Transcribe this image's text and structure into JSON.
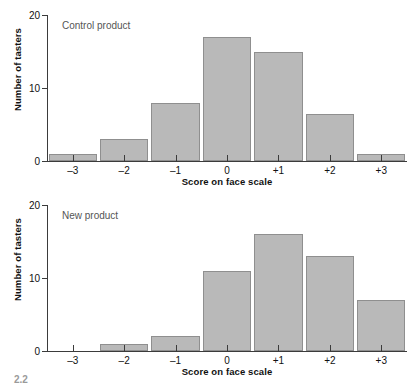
{
  "figure": {
    "caption": "2.2"
  },
  "chart_data": [
    {
      "type": "bar",
      "title": "Control product",
      "xlabel": "Score on face scale",
      "ylabel": "Number of tasters",
      "categories": [
        "–3",
        "–2",
        "–1",
        "0",
        "+1",
        "+2",
        "+3"
      ],
      "values": [
        1,
        3,
        8,
        17,
        15,
        6.5,
        1
      ],
      "ylim": [
        0,
        20
      ],
      "yticks": [
        0,
        10,
        20
      ],
      "yticklabels": [
        "0",
        "10",
        "20"
      ],
      "grid": false,
      "legend": "none",
      "bar_color": "#b9b9b9",
      "bar_border_color": "#8f8f8f",
      "axis_color": "#3b3b3b"
    },
    {
      "type": "bar",
      "title": "New product",
      "xlabel": "Score on face scale",
      "ylabel": "Number of tasters",
      "categories": [
        "–3",
        "–2",
        "–1",
        "0",
        "+1",
        "+2",
        "+3"
      ],
      "values": [
        0,
        1,
        2,
        11,
        16,
        13,
        7
      ],
      "ylim": [
        0,
        20
      ],
      "yticks": [
        0,
        10,
        20
      ],
      "yticklabels": [
        "0",
        "10",
        "20"
      ],
      "grid": false,
      "legend": "none",
      "bar_color": "#b9b9b9",
      "bar_border_color": "#8f8f8f",
      "axis_color": "#3b3b3b"
    }
  ]
}
